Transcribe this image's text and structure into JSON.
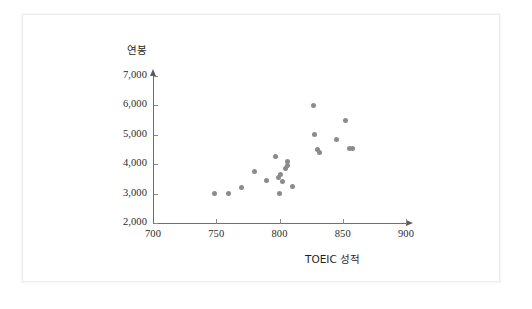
{
  "chart_data": {
    "type": "scatter",
    "title": "",
    "xlabel": "TOEIC 성적",
    "ylabel": "연봉",
    "xlim": [
      700,
      900
    ],
    "ylim": [
      2000,
      7000
    ],
    "xticks": [
      "700",
      "750",
      "800",
      "850",
      "900"
    ],
    "xtick_values": [
      700,
      750,
      800,
      850,
      900
    ],
    "yticks": [
      "2,000",
      "3,000",
      "4,000",
      "5,000",
      "6,000",
      "7,000"
    ],
    "ytick_values": [
      2000,
      3000,
      4000,
      5000,
      6000,
      7000
    ],
    "grid": false,
    "legend": null,
    "point_color": "#8b8b8b",
    "axis_color": "#6f6f6f",
    "points": [
      {
        "x": 749,
        "y": 3000
      },
      {
        "x": 760,
        "y": 3000
      },
      {
        "x": 770,
        "y": 3200
      },
      {
        "x": 780,
        "y": 3750
      },
      {
        "x": 790,
        "y": 3450
      },
      {
        "x": 797,
        "y": 4250
      },
      {
        "x": 799,
        "y": 3550
      },
      {
        "x": 801,
        "y": 3650
      },
      {
        "x": 802,
        "y": 3400
      },
      {
        "x": 805,
        "y": 3850
      },
      {
        "x": 806,
        "y": 4100
      },
      {
        "x": 806,
        "y": 3950
      },
      {
        "x": 800,
        "y": 3000
      },
      {
        "x": 810,
        "y": 3250
      },
      {
        "x": 827,
        "y": 6000
      },
      {
        "x": 828,
        "y": 5000
      },
      {
        "x": 830,
        "y": 4500
      },
      {
        "x": 832,
        "y": 4400
      },
      {
        "x": 845,
        "y": 4850
      },
      {
        "x": 852,
        "y": 5500
      },
      {
        "x": 855,
        "y": 4550
      },
      {
        "x": 858,
        "y": 4550
      }
    ]
  },
  "frame": {
    "border_color": "#ececed"
  }
}
